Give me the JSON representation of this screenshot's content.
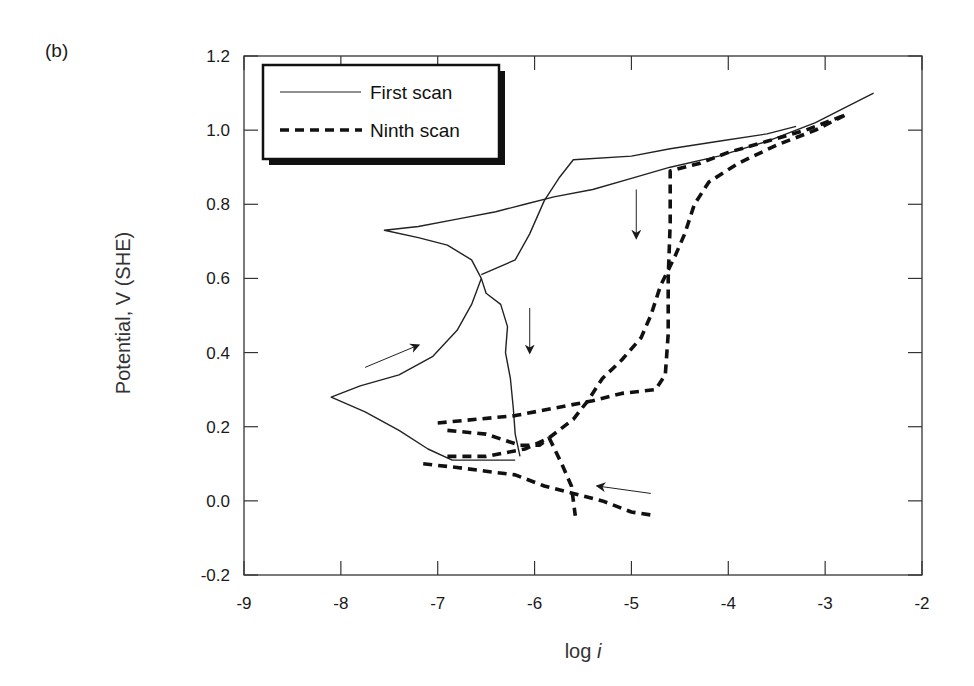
{
  "panel_label": "(b)",
  "chart_data": {
    "type": "line",
    "title": "",
    "xlabel": "log i",
    "xlabel_main": "log ",
    "xlabel_italic": "i",
    "ylabel": "Potential, V (SHE)",
    "xlim": [
      -9,
      -2
    ],
    "ylim": [
      -0.2,
      1.2
    ],
    "x_ticks": [
      -9,
      -8,
      -7,
      -6,
      -5,
      -4,
      -3,
      -2
    ],
    "x_tick_labels": [
      "-9",
      "-8",
      "-7",
      "-6",
      "-5",
      "-4",
      "-3",
      "-2"
    ],
    "y_ticks": [
      -0.2,
      0.0,
      0.2,
      0.4,
      0.6,
      0.8,
      1.0,
      1.2
    ],
    "y_tick_labels": [
      "-0.2",
      "0.0",
      "0.2",
      "0.4",
      "0.6",
      "0.8",
      "1.0",
      "1.2"
    ],
    "grid": false,
    "legend_position": "upper left",
    "legend": [
      {
        "label": "First scan",
        "style": "solid-thin"
      },
      {
        "label": "Ninth scan",
        "style": "dashed-thick"
      }
    ],
    "series": [
      {
        "name": "First scan",
        "style": "solid",
        "segments": [
          [
            [
              -6.2,
              0.11
            ],
            [
              -6.5,
              0.11
            ],
            [
              -6.85,
              0.11
            ],
            [
              -7.1,
              0.14
            ],
            [
              -7.4,
              0.19
            ],
            [
              -7.75,
              0.24
            ],
            [
              -8.1,
              0.28
            ],
            [
              -7.8,
              0.31
            ],
            [
              -7.4,
              0.34
            ],
            [
              -7.05,
              0.39
            ],
            [
              -6.8,
              0.46
            ],
            [
              -6.65,
              0.53
            ],
            [
              -6.55,
              0.6
            ],
            [
              -6.65,
              0.65
            ],
            [
              -6.9,
              0.69
            ],
            [
              -7.2,
              0.71
            ],
            [
              -7.55,
              0.73
            ],
            [
              -7.2,
              0.74
            ],
            [
              -6.8,
              0.76
            ],
            [
              -6.4,
              0.78
            ],
            [
              -6.1,
              0.8
            ],
            [
              -5.8,
              0.82
            ],
            [
              -5.4,
              0.84
            ],
            [
              -5.0,
              0.87
            ],
            [
              -4.6,
              0.9
            ],
            [
              -4.1,
              0.93
            ],
            [
              -3.6,
              0.97
            ],
            [
              -3.1,
              1.02
            ],
            [
              -2.8,
              1.06
            ],
            [
              -2.5,
              1.1
            ]
          ],
          [
            [
              -6.55,
              0.6
            ],
            [
              -6.5,
              0.56
            ],
            [
              -6.35,
              0.53
            ],
            [
              -6.28,
              0.47
            ],
            [
              -6.3,
              0.4
            ],
            [
              -6.25,
              0.33
            ],
            [
              -6.22,
              0.25
            ],
            [
              -6.2,
              0.18
            ],
            [
              -6.15,
              0.12
            ]
          ],
          [
            [
              -6.55,
              0.61
            ],
            [
              -6.2,
              0.65
            ],
            [
              -6.05,
              0.72
            ],
            [
              -5.9,
              0.81
            ],
            [
              -5.75,
              0.87
            ],
            [
              -5.6,
              0.92
            ],
            [
              -5.0,
              0.93
            ],
            [
              -4.6,
              0.95
            ],
            [
              -4.1,
              0.97
            ],
            [
              -3.6,
              0.99
            ],
            [
              -3.3,
              1.01
            ]
          ]
        ]
      },
      {
        "name": "Ninth scan",
        "style": "dashed",
        "segments": [
          [
            [
              -7.15,
              0.1
            ],
            [
              -6.8,
              0.09
            ],
            [
              -6.5,
              0.08
            ],
            [
              -6.2,
              0.07
            ],
            [
              -5.9,
              0.04
            ],
            [
              -5.6,
              0.02
            ],
            [
              -5.3,
              0.0
            ],
            [
              -5.0,
              -0.03
            ],
            [
              -4.75,
              -0.04
            ]
          ],
          [
            [
              -7.0,
              0.21
            ],
            [
              -6.6,
              0.22
            ],
            [
              -6.2,
              0.23
            ],
            [
              -5.8,
              0.25
            ],
            [
              -5.4,
              0.27
            ],
            [
              -5.1,
              0.29
            ],
            [
              -4.75,
              0.3
            ],
            [
              -4.65,
              0.34
            ],
            [
              -4.62,
              0.45
            ],
            [
              -4.62,
              0.6
            ],
            [
              -4.6,
              0.75
            ],
            [
              -4.6,
              0.89
            ],
            [
              -4.3,
              0.91
            ],
            [
              -4.0,
              0.94
            ],
            [
              -3.6,
              0.97
            ],
            [
              -3.2,
              1.0
            ],
            [
              -2.8,
              1.04
            ]
          ],
          [
            [
              -6.9,
              0.12
            ],
            [
              -6.5,
              0.12
            ],
            [
              -6.1,
              0.14
            ],
            [
              -5.85,
              0.17
            ],
            [
              -5.6,
              0.22
            ],
            [
              -5.45,
              0.27
            ],
            [
              -5.3,
              0.33
            ],
            [
              -5.1,
              0.38
            ],
            [
              -4.9,
              0.44
            ],
            [
              -4.8,
              0.5
            ],
            [
              -4.7,
              0.58
            ],
            [
              -4.55,
              0.66
            ],
            [
              -4.45,
              0.72
            ],
            [
              -4.35,
              0.8
            ],
            [
              -4.2,
              0.86
            ],
            [
              -3.9,
              0.91
            ],
            [
              -3.5,
              0.96
            ],
            [
              -3.1,
              1.0
            ],
            [
              -2.8,
              1.04
            ]
          ],
          [
            [
              -5.85,
              0.17
            ],
            [
              -5.72,
              0.1
            ],
            [
              -5.62,
              0.04
            ],
            [
              -5.58,
              -0.04
            ]
          ],
          [
            [
              -6.9,
              0.19
            ],
            [
              -6.5,
              0.18
            ],
            [
              -6.15,
              0.15
            ],
            [
              -5.95,
              0.15
            ],
            [
              -5.85,
              0.17
            ]
          ]
        ]
      }
    ],
    "annotations": [
      {
        "type": "arrow",
        "from": [
          -7.75,
          0.36
        ],
        "to": [
          -7.2,
          0.42
        ],
        "note": "forward scan direction"
      },
      {
        "type": "arrow",
        "from": [
          -6.05,
          0.52
        ],
        "to": [
          -6.05,
          0.4
        ],
        "note": "downward"
      },
      {
        "type": "arrow",
        "from": [
          -4.95,
          0.84
        ],
        "to": [
          -4.95,
          0.71
        ],
        "note": "downward"
      },
      {
        "type": "arrow",
        "from": [
          -4.8,
          0.02
        ],
        "to": [
          -5.35,
          0.04
        ],
        "note": "reverse direction"
      }
    ]
  }
}
